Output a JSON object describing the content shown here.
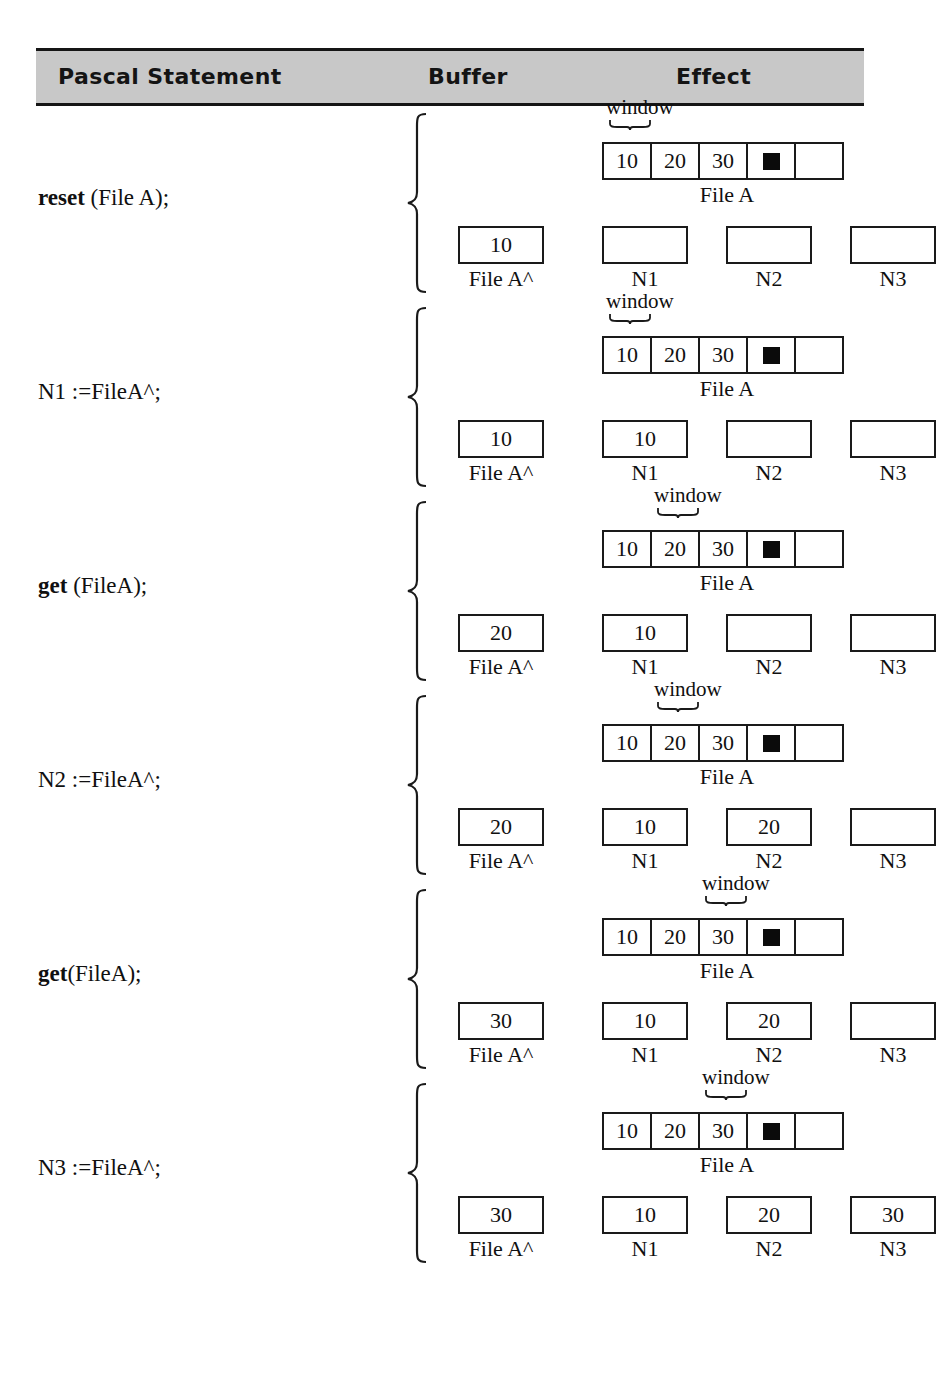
{
  "figure": {
    "header": {
      "col_statement": "Pascal Statement",
      "col_buffer": "Buffer",
      "col_effect": "Effect",
      "band_color": "#c8c8c8",
      "rule_color": "#151515"
    },
    "labels": {
      "window": "window",
      "file_caption": "File A",
      "buffer_caption": "File A^",
      "eof_marker": "eof",
      "var_names": [
        "N1",
        "N2",
        "N3"
      ]
    },
    "tape_cells": [
      "10",
      "20",
      "30",
      "eof",
      ""
    ],
    "rows": [
      {
        "statement_bold": "reset",
        "statement_rest": " (File A);",
        "window_index": 0,
        "buffer": "10",
        "tape": [
          "10",
          "20",
          "30",
          "eof",
          ""
        ],
        "vars": [
          "",
          "",
          ""
        ]
      },
      {
        "statement_bold": "",
        "statement_rest": "N1 :=FileA^;",
        "window_index": 0,
        "buffer": "10",
        "tape": [
          "10",
          "20",
          "30",
          "eof",
          ""
        ],
        "vars": [
          "10",
          "",
          ""
        ]
      },
      {
        "statement_bold": "get",
        "statement_rest": " (FileA);",
        "window_index": 1,
        "buffer": "20",
        "tape": [
          "10",
          "20",
          "30",
          "eof",
          ""
        ],
        "vars": [
          "10",
          "",
          ""
        ]
      },
      {
        "statement_bold": "",
        "statement_rest": "N2 :=FileA^;",
        "window_index": 1,
        "buffer": "20",
        "tape": [
          "10",
          "20",
          "30",
          "eof",
          ""
        ],
        "vars": [
          "10",
          "20",
          ""
        ]
      },
      {
        "statement_bold": "get",
        "statement_rest": "(FileA);",
        "window_index": 2,
        "buffer": "30",
        "tape": [
          "10",
          "20",
          "30",
          "eof",
          ""
        ],
        "vars": [
          "10",
          "20",
          ""
        ]
      },
      {
        "statement_bold": "",
        "statement_rest": "N3 :=FileA^;",
        "window_index": 2,
        "buffer": "30",
        "tape": [
          "10",
          "20",
          "30",
          "eof",
          ""
        ],
        "vars": [
          "10",
          "20",
          "30"
        ]
      }
    ]
  }
}
